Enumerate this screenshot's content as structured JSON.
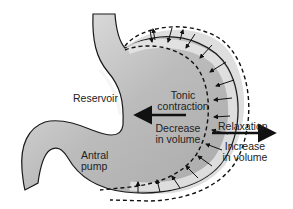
{
  "diagram": {
    "labels": {
      "reservoir": "Reservoir",
      "tonic_line1": "Tonic",
      "tonic_line2": "contraction",
      "decrease_line1": "Decrease",
      "decrease_line2": "in volume",
      "antral_line1": "Antral",
      "antral_line2": "pump",
      "relaxation": "Relaxation",
      "increase_line1": "Increase",
      "increase_line2": "in volume"
    },
    "colors": {
      "stomach_fill": "#bdbdbd",
      "wall_band": "#dcdcdc",
      "outline": "#1a1a1a",
      "text": "#222222"
    }
  }
}
